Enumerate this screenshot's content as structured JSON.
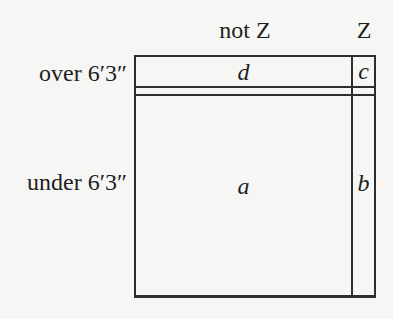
{
  "colors": {
    "background": "#f6f6f4",
    "line": "#2e2e2e",
    "text": "#1e1e1e"
  },
  "diagram": {
    "columns": [
      {
        "label": "not Z"
      },
      {
        "label": "Z"
      }
    ],
    "rows": [
      {
        "label": "over 6′3″"
      },
      {
        "label": "under 6′3″"
      }
    ],
    "cells": {
      "d": "d",
      "c": "c",
      "a": "a",
      "b": "b"
    }
  }
}
